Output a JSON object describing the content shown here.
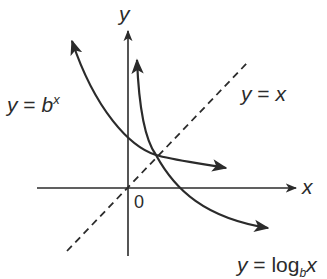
{
  "diagram": {
    "title": "",
    "axes": {
      "x_label": "x",
      "y_label": "y",
      "origin_label": "0"
    },
    "curves": [
      {
        "id": "exponential",
        "label_var": "y",
        "label_eq": "=",
        "label_base": "b",
        "label_exp": "x",
        "style": "solid"
      },
      {
        "id": "identity",
        "label_var": "y",
        "label_eq": "=",
        "label_rhs": "x",
        "style": "dashed"
      },
      {
        "id": "logarithm",
        "label_var": "y",
        "label_eq": "=",
        "label_func": "log",
        "label_base": "b",
        "label_arg": "x",
        "style": "solid"
      }
    ],
    "colors": {
      "ink": "#2b2b2b",
      "background": "#ffffff"
    }
  }
}
